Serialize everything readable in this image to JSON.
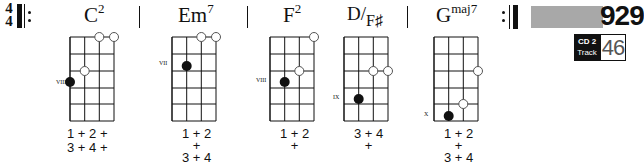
{
  "header": {
    "time_signature": {
      "top": "4",
      "bottom": "4"
    },
    "track_number": "929",
    "cd_label": "CD 2",
    "track_label": "Track",
    "track_id": "46"
  },
  "chords": [
    {
      "name": "C",
      "sup": "2",
      "position": "VIII",
      "counts": [
        "1 + 2 +",
        "3 + 4 +"
      ]
    },
    {
      "name": "Em",
      "sup": "7",
      "position": "VII",
      "counts": [
        "1 + 2",
        "   +",
        "3 + 4"
      ]
    },
    {
      "name": "F",
      "sup": "2",
      "position": "VIII",
      "counts": [
        "1 + 2",
        "   +"
      ]
    },
    {
      "name": "D/F♯",
      "sup": "",
      "position": "IX",
      "counts": [
        "3 + 4",
        "   +"
      ]
    },
    {
      "name": "G",
      "sup": "maj7",
      "position": "X",
      "counts": [
        "1 + 2",
        "   +",
        "3 + 4"
      ]
    }
  ]
}
